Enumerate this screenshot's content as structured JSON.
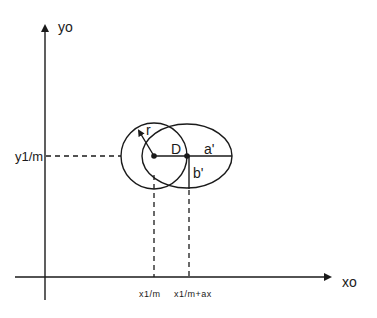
{
  "diagram": {
    "axes": {
      "x_label": "xo",
      "y_label": "yo"
    },
    "ticks": {
      "y_tick": "y1/m",
      "x_tick_1": "x1/m",
      "x_tick_2": "x1/m+ax"
    },
    "shapes": {
      "circle_radius_label": "r",
      "distance_label": "D",
      "ellipse_semi_major_label": "a'",
      "ellipse_semi_minor_label": "b'"
    },
    "colors": {
      "stroke": "#1a1a1a",
      "background": "#ffffff"
    }
  }
}
